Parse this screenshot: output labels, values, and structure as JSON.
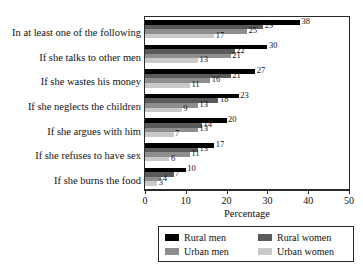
{
  "chart_data": {
    "type": "bar",
    "orientation": "horizontal",
    "title": "",
    "xlabel": "Percentage",
    "ylabel": "",
    "xlim": [
      0,
      50
    ],
    "xticks": [
      0,
      10,
      20,
      30,
      40,
      50
    ],
    "grid": false,
    "legend_position": "bottom",
    "categories": [
      "In at least one of the following",
      "If she talks to other men",
      "If she wastes his money",
      "If she neglects the children",
      "If she argues with him",
      "If she refuses to have sex",
      "If she burns the food"
    ],
    "series": [
      {
        "name": "Rural men",
        "color": "#000000",
        "values": [
          38,
          30,
          27,
          23,
          20,
          17,
          10
        ]
      },
      {
        "name": "Rural women",
        "color": "#5a5a5a",
        "values": [
          29,
          22,
          21,
          18,
          14,
          13,
          7
        ]
      },
      {
        "name": "Urban men",
        "color": "#8e8e8e",
        "values": [
          25,
          21,
          16,
          13,
          13,
          11,
          4
        ]
      },
      {
        "name": "Urban women",
        "color": "#c9c9c9",
        "values": [
          17,
          13,
          11,
          9,
          7,
          6,
          3
        ]
      }
    ]
  },
  "legend": {
    "entries": [
      {
        "label": "Rural men"
      },
      {
        "label": "Rural women"
      },
      {
        "label": "Urban men"
      },
      {
        "label": "Urban women"
      }
    ]
  }
}
